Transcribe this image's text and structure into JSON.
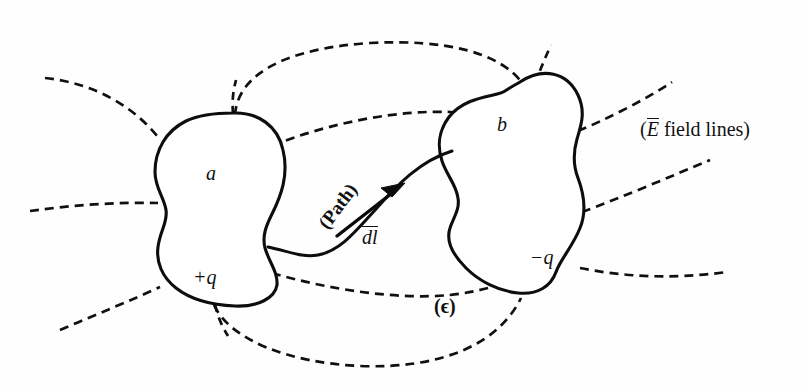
{
  "figure": {
    "background_color": "#fefefe",
    "ink_color": "#101010",
    "width": 806,
    "height": 388
  },
  "conductors": [
    {
      "id": "conductor-a",
      "name_label": "a",
      "charge_label": "+q",
      "charge_sign": "positive",
      "name_label_pos": {
        "x": 206,
        "y": 163
      },
      "charge_label_pos": {
        "x": 193,
        "y": 267
      }
    },
    {
      "id": "conductor-b",
      "name_label": "b",
      "charge_label": "−q",
      "charge_sign": "negative",
      "name_label_pos": {
        "x": 497,
        "y": 114
      },
      "charge_label_pos": {
        "x": 530,
        "y": 247
      }
    }
  ],
  "annotations": {
    "field_lines_caption": {
      "prefix": "(",
      "symbol": "E",
      "symbol_overbar": true,
      "text": " field lines",
      "suffix": ")",
      "full_text": "(Ē field lines)",
      "pos": {
        "x": 640,
        "y": 118
      }
    },
    "permittivity": {
      "full_text": "(ϵ)",
      "symbol": "ϵ",
      "pos": {
        "x": 434,
        "y": 296
      }
    },
    "path_label": {
      "full_text": "(Path)",
      "rotation_deg": -53,
      "pos": {
        "x": 330,
        "y": 213
      }
    },
    "dl_label": {
      "full_text": "dl",
      "overbar": true,
      "symbol": "dl",
      "pos": {
        "x": 362,
        "y": 226
      }
    }
  },
  "path": {
    "name": "integration-path",
    "style": "solid",
    "description": "S-shaped curve from conductor a to conductor b",
    "start": {
      "x": 268,
      "y": 247
    },
    "end": {
      "x": 452,
      "y": 150
    }
  },
  "dl_vector": {
    "name": "dl-vector-arrow",
    "tail": {
      "x": 337,
      "y": 235
    },
    "tip": {
      "x": 402,
      "y": 186
    }
  },
  "field_lines": {
    "style": "dashed",
    "dash_length": 9,
    "gap_length": 6,
    "count": 13,
    "groups": [
      {
        "name": "left-outgoing",
        "count": 3
      },
      {
        "name": "top-arcs",
        "count": 2
      },
      {
        "name": "bottom-arcs",
        "count": 2
      },
      {
        "name": "right-outgoing",
        "count": 3
      },
      {
        "name": "top-stubs",
        "count": 2
      },
      {
        "name": "bottom-stubs",
        "count": 1
      }
    ]
  }
}
